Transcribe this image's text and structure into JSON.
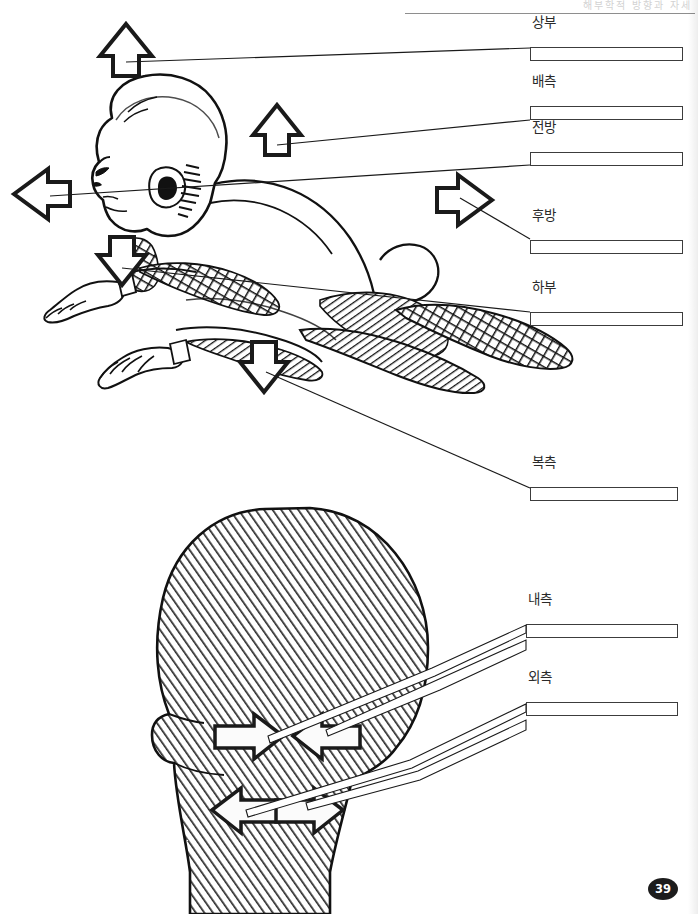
{
  "page": {
    "header_text": "해부학적 방향과 자세",
    "page_number": "39",
    "background": "#ffffff",
    "ink": "#1a1a1a"
  },
  "figure_baby": {
    "name": "infant-prone-figure",
    "description": "Line drawing of an infant lying prone, in profile facing left, with hatched shading on limbs",
    "arrows": [
      {
        "id": "arrow-superior",
        "direction": "up",
        "label_ref": "superior"
      },
      {
        "id": "arrow-dorsal",
        "direction": "up",
        "label_ref": "dorsal"
      },
      {
        "id": "arrow-anterior",
        "direction": "left",
        "label_ref": "anterior"
      },
      {
        "id": "arrow-posterior",
        "direction": "right",
        "label_ref": "posterior"
      },
      {
        "id": "arrow-inferior",
        "direction": "down",
        "label_ref": "inferior"
      },
      {
        "id": "arrow-ventral",
        "direction": "down",
        "label_ref": "ventral"
      }
    ]
  },
  "figure_head": {
    "name": "posterior-head-figure",
    "description": "Hatched drawing of the back of a human head and neck with four white block arrows",
    "arrows": [
      {
        "id": "arrow-medial-right",
        "direction": "right",
        "label_ref": "medial"
      },
      {
        "id": "arrow-medial-left",
        "direction": "left",
        "label_ref": "medial"
      },
      {
        "id": "arrow-lateral-left",
        "direction": "left",
        "label_ref": "lateral"
      },
      {
        "id": "arrow-lateral-right",
        "direction": "right",
        "label_ref": "lateral"
      }
    ]
  },
  "answers": [
    {
      "key": "superior",
      "label": "상부",
      "x": 530,
      "y": 47,
      "w": 153,
      "blank": ""
    },
    {
      "key": "dorsal",
      "label": "배측",
      "x": 530,
      "y": 106,
      "w": 153,
      "blank": ""
    },
    {
      "key": "anterior",
      "label": "전방",
      "x": 530,
      "y": 152,
      "w": 153,
      "blank": ""
    },
    {
      "key": "posterior",
      "label": "후방",
      "x": 530,
      "y": 240,
      "w": 153,
      "blank": ""
    },
    {
      "key": "inferior",
      "label": "하부",
      "x": 530,
      "y": 312,
      "w": 153,
      "blank": ""
    },
    {
      "key": "ventral",
      "label": "복측",
      "x": 530,
      "y": 487,
      "w": 148,
      "blank": ""
    },
    {
      "key": "medial",
      "label": "내측",
      "x": 526,
      "y": 624,
      "w": 152,
      "blank": ""
    },
    {
      "key": "lateral",
      "label": "외측",
      "x": 526,
      "y": 702,
      "w": 152,
      "blank": ""
    }
  ]
}
